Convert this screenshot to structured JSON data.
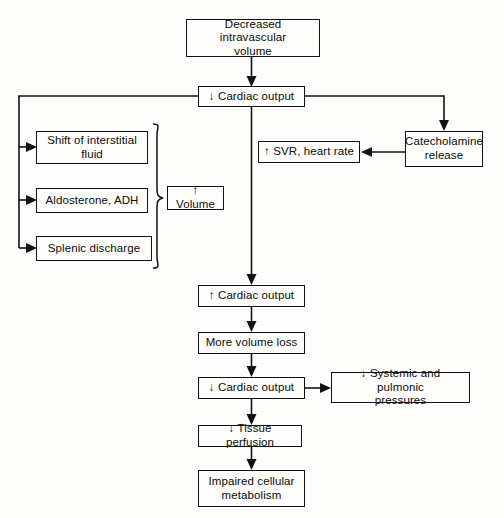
{
  "diagram": {
    "type": "flowchart",
    "line_color": "#121212",
    "background_color": "#fdfdfb"
  },
  "nodes": [
    {
      "id": "decreased_volume",
      "label": "Decreased intravascular\nvolume"
    },
    {
      "id": "cardiac_output_down",
      "label": "↓ Cardiac output"
    },
    {
      "id": "shift_fluid",
      "label": "Shift of interstitial\nfluid"
    },
    {
      "id": "aldosterone",
      "label": "Aldosterone, ADH"
    },
    {
      "id": "splenic",
      "label": "Splenic discharge"
    },
    {
      "id": "volume_up",
      "label": "↑ Volume"
    },
    {
      "id": "catecholamine",
      "label": "Catecholamine\nrelease"
    },
    {
      "id": "svr_hr",
      "label": "↑ SVR, heart rate"
    },
    {
      "id": "cardiac_output_up",
      "label": "↑ Cardiac output"
    },
    {
      "id": "more_volume_loss",
      "label": "More volume loss"
    },
    {
      "id": "cardiac_output_down2",
      "label": "↓ Cardiac output"
    },
    {
      "id": "pressures_down",
      "label": "↓ Systemic and pulmonic\npressures"
    },
    {
      "id": "tissue_perfusion",
      "label": "↓ Tissue perfusion"
    },
    {
      "id": "impaired_metabolism",
      "label": "Impaired cellular\nmetabolism"
    }
  ],
  "edges": [
    {
      "from": "decreased_volume",
      "to": "cardiac_output_down",
      "style": "arrow-down"
    },
    {
      "from": "cardiac_output_down",
      "to": "shift_fluid",
      "style": "feedback-left"
    },
    {
      "from": "cardiac_output_down",
      "to": "aldosterone",
      "style": "feedback-left"
    },
    {
      "from": "cardiac_output_down",
      "to": "splenic",
      "style": "feedback-left"
    },
    {
      "from": "cardiac_output_down",
      "to": "catecholamine",
      "style": "elbow-right"
    },
    {
      "from": "catecholamine",
      "to": "svr_hr",
      "style": "arrow-left"
    },
    {
      "from": "cardiac_output_down",
      "to": "cardiac_output_up",
      "style": "arrow-down"
    },
    {
      "from": "cardiac_output_up",
      "to": "more_volume_loss",
      "style": "arrow-down"
    },
    {
      "from": "more_volume_loss",
      "to": "cardiac_output_down2",
      "style": "arrow-down"
    },
    {
      "from": "cardiac_output_down2",
      "to": "pressures_down",
      "style": "arrow-right"
    },
    {
      "from": "cardiac_output_down2",
      "to": "tissue_perfusion",
      "style": "arrow-down"
    },
    {
      "from": "tissue_perfusion",
      "to": "impaired_metabolism",
      "style": "arrow-down"
    }
  ],
  "grouping": {
    "brace_label_node": "volume_up",
    "braced_nodes": [
      "shift_fluid",
      "aldosterone",
      "splenic"
    ]
  }
}
